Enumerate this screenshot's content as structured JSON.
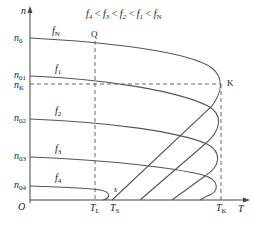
{
  "diagram": {
    "title": "f4 < f3 < f2 < f1 < fN",
    "title_parts": [
      "f",
      "4",
      " < ",
      "f",
      "3",
      " < ",
      "f",
      "2",
      " < ",
      "f",
      "1",
      " < ",
      "f",
      "N"
    ],
    "axes": {
      "y_label": "n",
      "x_label": "T",
      "origin_label": "O"
    },
    "y_ticks": [
      {
        "main": "n",
        "sub": "0"
      },
      {
        "main": "n",
        "sub": "01"
      },
      {
        "main": "n",
        "sub": "K"
      },
      {
        "main": "n",
        "sub": "02"
      },
      {
        "main": "n",
        "sub": "03"
      },
      {
        "main": "n",
        "sub": "04"
      }
    ],
    "x_ticks": [
      {
        "main": "T",
        "sub": "L"
      },
      {
        "main": "T",
        "sub": "S"
      },
      {
        "main": "T",
        "sub": "K"
      }
    ],
    "curves": [
      {
        "main": "f",
        "sub": "N"
      },
      {
        "main": "f",
        "sub": "1"
      },
      {
        "main": "f",
        "sub": "2"
      },
      {
        "main": "f",
        "sub": "3"
      },
      {
        "main": "f",
        "sub": "4"
      }
    ],
    "points": {
      "q": "Q",
      "k": "K",
      "s": "s"
    },
    "colors": {
      "line": "#555555",
      "text": "#222222"
    }
  }
}
